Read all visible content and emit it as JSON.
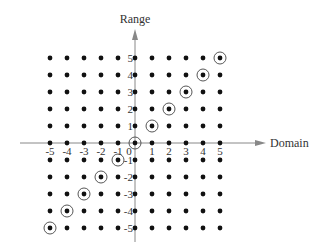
{
  "chart_data": {
    "type": "scatter",
    "title": "",
    "xlabel": "Domain",
    "ylabel": "Range",
    "xlim": [
      -5,
      5
    ],
    "ylim": [
      -5,
      5
    ],
    "grid": false,
    "legend": null,
    "x_ticks": [
      -5,
      -4,
      -3,
      -2,
      -1,
      0,
      1,
      2,
      3,
      4,
      5
    ],
    "y_ticks": [
      -5,
      -4,
      -3,
      -2,
      -1,
      1,
      2,
      3,
      4,
      5
    ],
    "lattice": {
      "description": "All integer points (x, y) with -5 <= x <= 5 and -5 <= y <= 5 shown as dots",
      "x_values": [
        -5,
        -4,
        -3,
        -2,
        -1,
        0,
        1,
        2,
        3,
        4,
        5
      ],
      "y_values": [
        -5,
        -4,
        -3,
        -2,
        -1,
        0,
        1,
        2,
        3,
        4,
        5
      ]
    },
    "series": [
      {
        "name": "circled points (y = x)",
        "points": [
          [
            -5,
            -5
          ],
          [
            -4,
            -4
          ],
          [
            -3,
            -3
          ],
          [
            -2,
            -2
          ],
          [
            -1,
            -1
          ],
          [
            0,
            0
          ],
          [
            1,
            1
          ],
          [
            2,
            2
          ],
          [
            3,
            3
          ],
          [
            4,
            4
          ],
          [
            5,
            5
          ]
        ]
      }
    ]
  },
  "labels": {
    "x_axis": "Domain",
    "y_axis": "Range",
    "origin": "0"
  },
  "colors": {
    "dot": "#111111",
    "axis": "#888888",
    "text": "#333333",
    "circle": "#444444"
  }
}
